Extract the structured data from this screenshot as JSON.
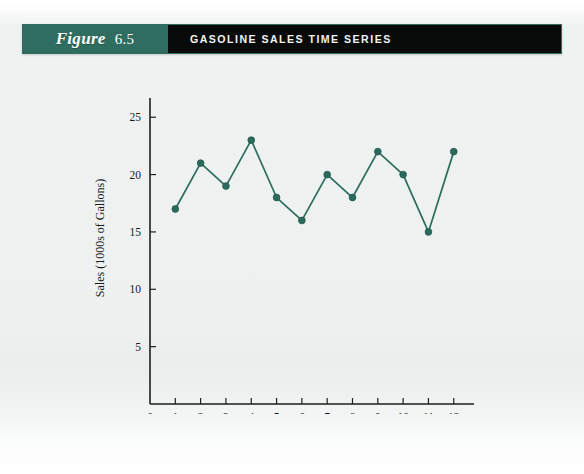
{
  "figure": {
    "label_word": "Figure",
    "number": "6.5",
    "title": "GASOLINE SALES TIME SERIES"
  },
  "colors": {
    "banner_green": "#2e6d5f",
    "banner_black": "#090b0a",
    "series_green": "#2d6d5e",
    "axis_black": "#1d1f1f",
    "page_background": "#eef1f0"
  },
  "chart_data": {
    "type": "line",
    "title": "GASOLINE SALES TIME SERIES",
    "xlabel": "Week",
    "ylabel": "Sales (1000s of Gallons)",
    "x": [
      1,
      2,
      3,
      4,
      5,
      6,
      7,
      8,
      9,
      10,
      11,
      12
    ],
    "values": [
      17,
      21,
      19,
      23,
      18,
      16,
      20,
      18,
      22,
      20,
      15,
      22
    ],
    "series": [
      {
        "name": "Sales (1000s of Gallons)",
        "values": [
          17,
          21,
          19,
          23,
          18,
          16,
          20,
          18,
          22,
          20,
          15,
          22
        ]
      }
    ],
    "xlim": [
      0,
      12.8
    ],
    "ylim": [
      0,
      26.5
    ],
    "xticks": [
      0,
      1,
      2,
      3,
      4,
      5,
      6,
      7,
      8,
      9,
      10,
      11,
      12
    ],
    "xticklabels": [
      "0",
      "1",
      "2",
      "3",
      "4",
      "5",
      "6",
      "7",
      "8",
      "9",
      "10",
      "11",
      "12"
    ],
    "yticks": [
      5,
      10,
      15,
      20,
      25
    ],
    "yticklabels": [
      "5",
      "10",
      "15",
      "20",
      "25"
    ],
    "grid": false,
    "legend": false,
    "markers": "filled-circle"
  }
}
